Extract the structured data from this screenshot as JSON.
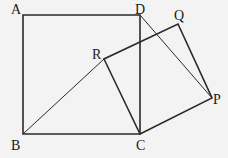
{
  "diagram": {
    "type": "geometry",
    "points": {
      "A": {
        "label": "A",
        "x": 23,
        "y": 15
      },
      "B": {
        "label": "B",
        "x": 23,
        "y": 134
      },
      "C": {
        "label": "C",
        "x": 140,
        "y": 134
      },
      "D": {
        "label": "D",
        "x": 140,
        "y": 15
      },
      "P": {
        "label": "P",
        "x": 212,
        "y": 98
      },
      "Q": {
        "label": "Q",
        "x": 178,
        "y": 24
      },
      "R": {
        "label": "R",
        "x": 104,
        "y": 59
      }
    },
    "segments": [
      "AB",
      "BC",
      "CD",
      "DA",
      "CP",
      "PQ",
      "QR",
      "RC",
      "BR",
      "DP"
    ],
    "colors": {
      "background": "#f3f3f3",
      "stroke": "#2a2a2a"
    }
  }
}
